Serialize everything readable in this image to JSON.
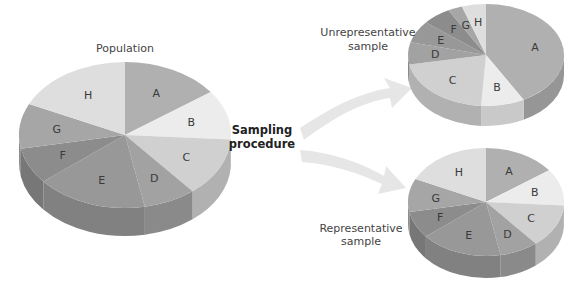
{
  "labels": {
    "population": "Population",
    "sampling_line1": "Sampling",
    "sampling_line2": "procedure",
    "unrep_line1": "Unrepresentative",
    "unrep_line2": "sample",
    "rep_line1": "Representative",
    "rep_line2": "sample"
  },
  "slice_labels": [
    "A",
    "B",
    "C",
    "D",
    "E",
    "F",
    "G",
    "H"
  ],
  "colors": {
    "A": "#b0b0b0",
    "B": "#ececec",
    "C": "#d0d0d0",
    "D": "#a2a2a2",
    "E": "#989898",
    "F": "#8c8c8c",
    "G": "#a6a6a6",
    "H": "#dedede",
    "arrow": "#e4e4e4"
  },
  "chart_data": [
    {
      "type": "pie",
      "title": "Population",
      "categories": [
        "A",
        "B",
        "C",
        "D",
        "E",
        "F",
        "G",
        "H"
      ],
      "values": [
        15,
        11,
        13,
        8,
        17,
        8,
        10,
        18
      ]
    },
    {
      "type": "pie",
      "title": "Unrepresentative sample",
      "categories": [
        "A",
        "B",
        "C",
        "D",
        "E",
        "F",
        "G",
        "H"
      ],
      "values": [
        42,
        9,
        21,
        7,
        7,
        6,
        3,
        5
      ]
    },
    {
      "type": "pie",
      "title": "Representative sample",
      "categories": [
        "A",
        "B",
        "C",
        "D",
        "E",
        "F",
        "G",
        "H"
      ],
      "values": [
        15,
        11,
        13,
        8,
        17,
        8,
        10,
        18
      ]
    }
  ]
}
